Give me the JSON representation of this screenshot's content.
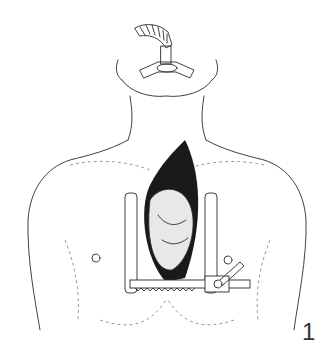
{
  "figure": {
    "number": "1",
    "colors": {
      "ink": "#2b2b2b",
      "background": "#ffffff"
    }
  }
}
